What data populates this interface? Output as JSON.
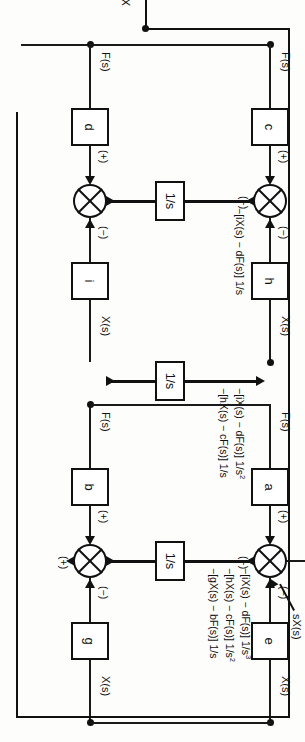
{
  "diagram": {
    "type": "control-system-block-diagram",
    "orientation": "rotated-90-clockwise",
    "top_output_label": "X(s)",
    "derivative_label": "sX(s)",
    "integrator_label": "1/s",
    "sign_plus": "(+)",
    "sign_minus": "(−)",
    "input_label": "F(s)",
    "output_label": "X(s)"
  },
  "stages": [
    {
      "id": "stage-1",
      "forward_gain": "a",
      "feedback_gain": "e",
      "integrator": "1/s",
      "input_label": "F(s)",
      "output_label": "X(s)",
      "sum_left_sign": "(+)",
      "sum_right_sign": "(−)",
      "sum_bottom_sign": "(+)",
      "equation_lines": [
        {
          "text": "−[iX(s) − dF(s)] 1/s",
          "exp": "3"
        },
        {
          "text": "−[hX(s) − cF(s)] 1/s",
          "exp": "2"
        },
        {
          "text": "−[gX(s) − bF(s)] 1/s",
          "exp": ""
        }
      ]
    },
    {
      "id": "stage-2",
      "forward_gain": "b",
      "feedback_gain": "g",
      "integrator": "1/s",
      "input_label": "F(s)",
      "output_label": "X(s)",
      "sum_left_sign": "(+)",
      "sum_right_sign": "(−)",
      "sum_bottom_sign": "(+)",
      "equation_lines": [
        {
          "text": "−[iX(s) − dF(s)] 1/s",
          "exp": "2"
        },
        {
          "text": "−[hX(s) − cF(s)] 1/s",
          "exp": ""
        }
      ]
    },
    {
      "id": "stage-3",
      "forward_gain": "c",
      "feedback_gain": "h",
      "integrator": "1/s",
      "input_label": "F(s)",
      "output_label": "X(s)",
      "sum_left_sign": "(+)",
      "sum_right_sign": "(−)",
      "sum_bottom_sign": "(+)",
      "equation_lines": [
        {
          "text": "−[iX(s) − dF(s)] 1/s",
          "exp": ""
        }
      ]
    },
    {
      "id": "stage-4",
      "forward_gain": "d",
      "feedback_gain": "i",
      "integrator": "1/s",
      "input_label": "F(s)",
      "output_label": "X(s)",
      "sum_left_sign": "(+)",
      "sum_right_sign": "(−)",
      "sum_bottom_sign": "",
      "equation_lines": []
    }
  ],
  "colors": {
    "ink": "#111111",
    "paper": "#fdfdfb"
  }
}
